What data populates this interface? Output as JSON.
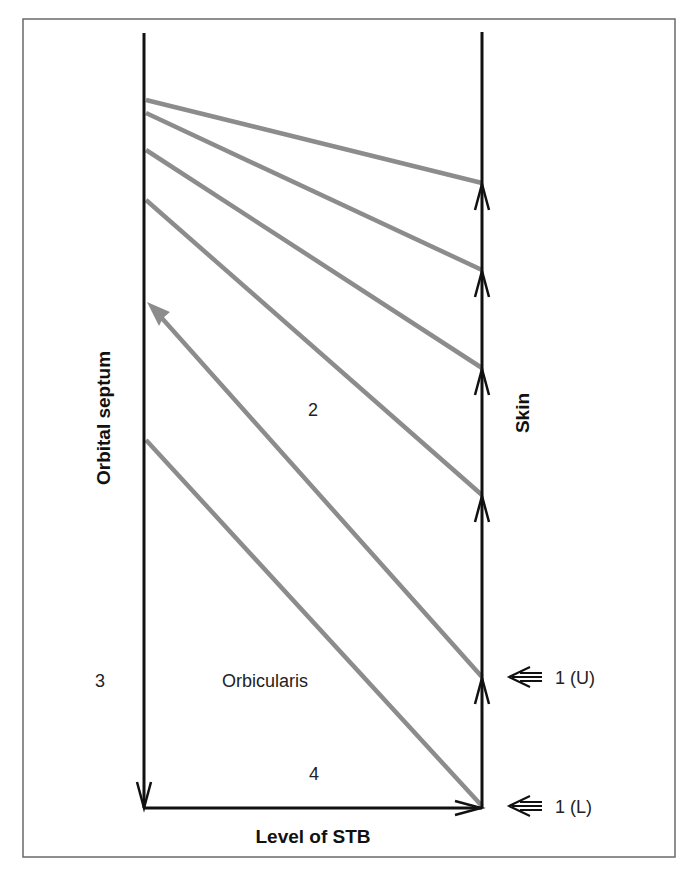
{
  "figure": {
    "frame": {
      "x": 23,
      "y": 19,
      "width": 652,
      "height": 838,
      "color": "#6a6a6a"
    },
    "colors": {
      "structure_line": "#111111",
      "gray_line": "#8c8c8c",
      "text": "#333333"
    }
  },
  "labels": {
    "left_axis": "Orbital septum",
    "right_axis": "Skin",
    "bottom_axis": "Level of STB",
    "region_2": "2",
    "region_3": "3",
    "region_4": "4",
    "muscle": "Orbicularis",
    "marker_upper": "1 (U)",
    "marker_lower": "1 (L)"
  },
  "diagram": {
    "left_line": {
      "x": 144,
      "y_top": 33,
      "y_bottom": 808,
      "arrow": "down"
    },
    "right_line": {
      "x": 482,
      "y_top": 32,
      "y_bottom": 808
    },
    "bottom_line": {
      "y": 808,
      "x_start": 144,
      "x_end": 482,
      "arrow": "right"
    },
    "gray_lines": [
      {
        "x1": 146,
        "y1": 100,
        "x2": 482,
        "y2": 183
      },
      {
        "x1": 146,
        "y1": 113,
        "x2": 482,
        "y2": 270
      },
      {
        "x1": 146,
        "y1": 150,
        "x2": 482,
        "y2": 368
      },
      {
        "x1": 146,
        "y1": 200,
        "x2": 482,
        "y2": 495
      },
      {
        "x1": 146,
        "y1": 440,
        "x2": 482,
        "y2": 806
      }
    ],
    "gray_arrow": {
      "x1": 482,
      "y1": 677,
      "x2": 148,
      "y2": 302
    },
    "right_arrowheads_y": [
      183,
      270,
      368,
      495,
      677
    ],
    "markers": [
      {
        "y": 677,
        "label_key": "marker_upper"
      },
      {
        "y": 806,
        "label_key": "marker_lower"
      }
    ]
  }
}
